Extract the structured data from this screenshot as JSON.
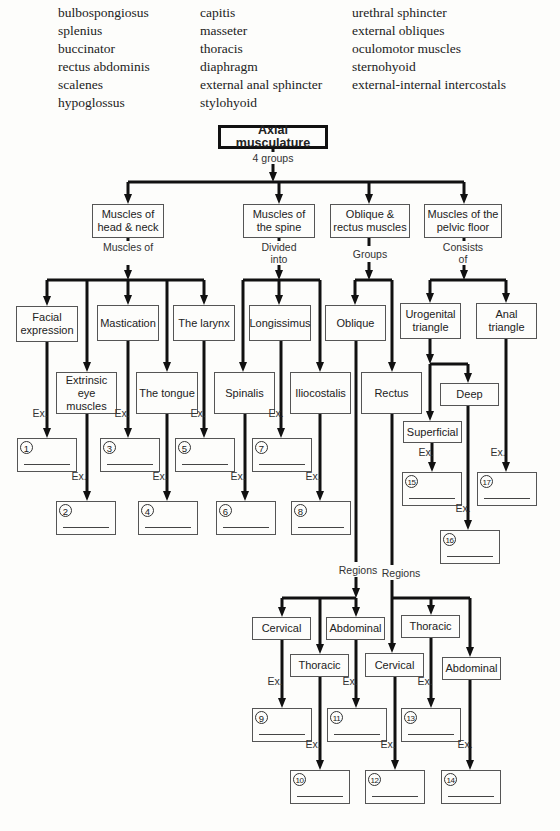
{
  "word_bank": {
    "columns": [
      [
        "bulbospongiosus",
        "splenius",
        "buccinator",
        "rectus abdominis",
        "scalenes",
        "hypoglossus"
      ],
      [
        "capitis",
        "masseter",
        "thoracis",
        "diaphragm",
        "external anal sphincter",
        "stylohyoid"
      ],
      [
        "urethral sphincter",
        "external obliques",
        "oculomotor muscles",
        "sternohyoid",
        "external-internal intercostals"
      ]
    ]
  },
  "diagram": {
    "root": "Axial musculature",
    "root_label": "4 groups",
    "groups": {
      "head_neck": "Muscles of head & neck",
      "spine": "Muscles of the spine",
      "oblique_rectus": "Oblique & rectus muscles",
      "pelvic": "Muscles of the pelvic floor"
    },
    "connectors": {
      "muscles_of": "Muscles of",
      "divided_into": "Divided into",
      "groups": "Groups",
      "consists_of": "Consists of",
      "regions": "Regions",
      "ex": "Ex."
    },
    "head_neck": {
      "facial": "Facial expression",
      "extrinsic": "Extrinsic eye muscles",
      "mastication": "Mastication",
      "tongue": "The tongue",
      "larynx": "The larynx"
    },
    "spine": {
      "spinalis": "Spinalis",
      "longissimus": "Longissimus",
      "iliocostalis": "Iliocostalis"
    },
    "oblique_rectus": {
      "oblique": "Oblique",
      "rectus": "Rectus",
      "oblique_regions": [
        "Cervical",
        "Thoracic",
        "Abdominal"
      ],
      "rectus_regions": [
        "Cervical",
        "Thoracic",
        "Abdominal"
      ]
    },
    "pelvic": {
      "urogenital": "Urogenital triangle",
      "anal": "Anal triangle",
      "superficial": "Superficial",
      "deep": "Deep"
    },
    "answer_numbers": [
      "1",
      "2",
      "3",
      "4",
      "5",
      "6",
      "7",
      "8",
      "9",
      "10",
      "11",
      "12",
      "13",
      "14",
      "15",
      "16",
      "17"
    ]
  }
}
